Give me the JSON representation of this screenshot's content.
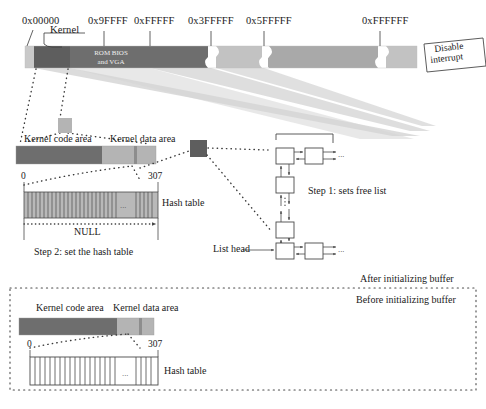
{
  "diagram": {
    "colors": {
      "light_gray": "#c9c9c9",
      "mid_gray": "#a9a9a9",
      "dark_gray": "#6e6e6e",
      "darker_gray": "#5e5e5e",
      "fan_gray": "#d2d2d2",
      "hash_fill": "#b9b9b9",
      "stroke": "#4a4a4a",
      "text": "#1a1a1a"
    }
  },
  "memory_bar": {
    "addresses": [
      {
        "label": "0x00000",
        "x": 22,
        "tick_x": 33
      },
      {
        "label": "0x9FFFF",
        "x": 88,
        "tick_x": 104
      },
      {
        "label": "0xFFFFF",
        "x": 134,
        "tick_x": 150
      },
      {
        "label": "0x3FFFFF",
        "x": 190,
        "tick_x": 211
      },
      {
        "label": "0x5FFFFF",
        "x": 248,
        "tick_x": 264
      },
      {
        "label": "0xFFFFFF",
        "x": 364,
        "tick_x": 380
      }
    ],
    "kernel_label": "Kernel",
    "rom_bios_label_line1": "ROM BIOS",
    "rom_bios_label_line2": "and VGA",
    "segments": [
      {
        "name": "low-memory",
        "x": 25,
        "w": 9,
        "color": "#c9c9c9"
      },
      {
        "name": "kernel",
        "x": 34,
        "w": 36,
        "color": "#5e5e5e"
      },
      {
        "name": "rom-bios-vga",
        "x": 70,
        "w": 80,
        "color": "#6e6e6e"
      },
      {
        "name": "ext-memory-1",
        "x": 150,
        "w": 61,
        "color": "#6e6e6e"
      },
      {
        "name": "ext-memory-2",
        "x": 216,
        "w": 48,
        "color": "#c2c2c2"
      },
      {
        "name": "ext-memory-3",
        "x": 269,
        "w": 111,
        "color": "#a9a9a9"
      },
      {
        "name": "ext-memory-4",
        "x": 385,
        "w": 32,
        "color": "#c2c2c2"
      }
    ]
  },
  "disable_interrupt": {
    "line1": "Disable",
    "line2": "interrupt"
  },
  "kernel_detail": {
    "code_area_label": "Kernel code area",
    "data_area_label": "Kernel data area",
    "bar": {
      "x": 16,
      "y": 146,
      "w": 140,
      "h": 18
    },
    "code_w": 86,
    "data_w": 45,
    "sep_w": 3,
    "buffer_block_label": "buffer-block"
  },
  "hash_table": {
    "index_min": "0",
    "index_max": "307",
    "label": "Hash table",
    "null_label": "NULL",
    "ellipsis": "...",
    "cells": 34
  },
  "steps": {
    "step1": "Step 1: sets free list",
    "step2": "Step 2: set the hash table",
    "list_head": "List head",
    "ellipsis": "..."
  },
  "bottom_panel": {
    "after_label": "After initializing buffer",
    "before_label": "Before initializing buffer",
    "code_area_label": "Kernel code area",
    "data_area_label": "Kernel data area",
    "index_min": "0",
    "index_max": "307",
    "hash_label": "Hash table",
    "ellipsis": "...",
    "cells": 26
  }
}
